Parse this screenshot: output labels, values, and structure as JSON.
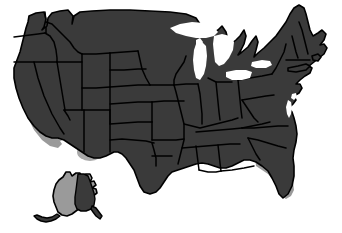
{
  "map": {
    "title": "United States Map",
    "type": "choropleth-selection-map",
    "projection": "albers-usa",
    "background_color": "#ffffff",
    "base_state_color": "#3a3a3a",
    "highlight_color": "#9a9a9a",
    "border_color": "#000000",
    "water_color": "#ffffff",
    "width": 342,
    "height": 233,
    "insets": [
      {
        "name": "alaska",
        "label": "Alaska",
        "highlighted": true,
        "partial": true
      }
    ],
    "water_bodies": [
      {
        "name": "lake-michigan",
        "label": "Lake Michigan"
      },
      {
        "name": "lake-superior",
        "label": "Lake Superior"
      },
      {
        "name": "lake-huron",
        "label": "Lake Huron"
      },
      {
        "name": "lake-erie",
        "label": "Lake Erie"
      },
      {
        "name": "lake-ontario",
        "label": "Lake Ontario"
      }
    ],
    "highlighted_states": [
      {
        "code": "CA",
        "label": "California"
      },
      {
        "code": "NV",
        "label": "Nevada"
      },
      {
        "code": "FL",
        "label": "Florida"
      },
      {
        "code": "AK",
        "label": "Alaska"
      }
    ],
    "legend": {
      "visible": false,
      "entries": [
        {
          "label": "Selected",
          "color": "#9a9a9a"
        },
        {
          "label": "Not selected",
          "color": "#3a3a3a"
        }
      ]
    }
  }
}
